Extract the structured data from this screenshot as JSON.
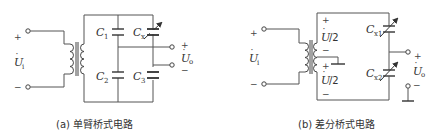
{
  "figures": [
    {
      "id": "a",
      "caption": "(a) 单臂桥式电路",
      "input": {
        "label": "U",
        "subscript": "i",
        "plus": "+",
        "minus": "−"
      },
      "output": {
        "label": "U",
        "subscript": "o",
        "plus": "+",
        "minus": "−"
      },
      "capacitors": [
        {
          "label": "C",
          "subscript": "1",
          "variable": false
        },
        {
          "label": "C",
          "subscript": "2",
          "variable": false
        },
        {
          "label": "C",
          "subscript": "x",
          "variable": true
        },
        {
          "label": "C",
          "subscript": "3",
          "variable": false
        }
      ]
    },
    {
      "id": "b",
      "caption": "(b) 差分桥式电路",
      "input": {
        "label": "U",
        "subscript": "i",
        "plus": "+",
        "minus": "−"
      },
      "output": {
        "label": "U",
        "subscript": "o",
        "plus": "+",
        "minus": "−"
      },
      "half_voltage": {
        "label": "U",
        "suffix": "/2",
        "plus": "+",
        "minus": "−"
      },
      "capacitors": [
        {
          "label": "C",
          "subscript": "x1",
          "variable": true
        },
        {
          "label": "C",
          "subscript": "x2",
          "variable": true
        }
      ]
    }
  ]
}
